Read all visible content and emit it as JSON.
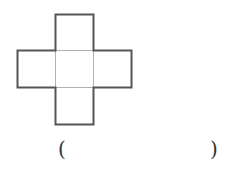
{
  "diagram": {
    "type": "cube-net",
    "squares": [
      {
        "row": 0,
        "col": 1
      },
      {
        "row": 1,
        "col": 0
      },
      {
        "row": 1,
        "col": 1
      },
      {
        "row": 1,
        "col": 2
      },
      {
        "row": 2,
        "col": 1
      }
    ],
    "stroke_outer": "#555555",
    "stroke_inner": "#aaaaaa"
  },
  "answer": {
    "left_paren": "(",
    "right_paren": ")",
    "value": ""
  }
}
